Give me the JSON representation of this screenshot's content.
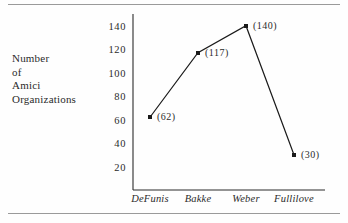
{
  "figure": {
    "background_color": "#fefefe",
    "rule_color": "#9a9a9a",
    "ink_color": "#2b2b2b"
  },
  "axis_caption": {
    "line1": "Number",
    "line2": "of",
    "line3": "Amici",
    "line4": "Organizations"
  },
  "chart_data": {
    "type": "line",
    "title": "",
    "xlabel": "",
    "ylabel": "Number of Amici Organizations",
    "categories": [
      "DeFunis",
      "Bakke",
      "Weber",
      "Fullilove"
    ],
    "values": [
      62,
      117,
      140,
      30
    ],
    "point_labels": [
      "(62)",
      "(117)",
      "(140)",
      "(30)"
    ],
    "ylim": [
      0,
      150
    ],
    "yticks": [
      20,
      40,
      60,
      80,
      100,
      120,
      140
    ],
    "ytick_labels": [
      "20",
      "40",
      "60",
      "80",
      "100",
      "120",
      "140"
    ],
    "grid": false,
    "legend": "none",
    "line_color": "#1a1a1a",
    "marker_color": "#1a1a1a"
  }
}
